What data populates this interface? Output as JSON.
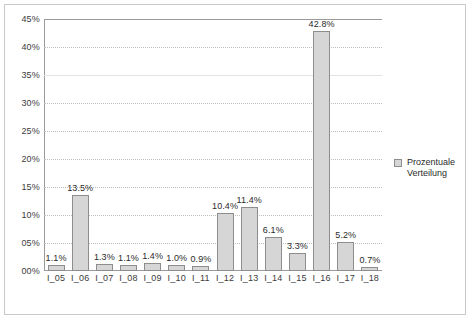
{
  "chart_data": {
    "type": "bar",
    "title": "",
    "subtitle": "",
    "xlabel": "",
    "ylabel": "",
    "ylim": [
      0,
      45
    ],
    "y_tick_step": 5,
    "y_tick_labels": [
      "00%",
      "05%",
      "10%",
      "15%",
      "20%",
      "25%",
      "30%",
      "35%",
      "40%",
      "45%"
    ],
    "y_tick_values": [
      0,
      5,
      10,
      15,
      20,
      25,
      30,
      35,
      40,
      45
    ],
    "grid": "horizontal-dotted",
    "legend_position": "right",
    "categories": [
      "I_05",
      "I_06",
      "I_07",
      "I_08",
      "I_09",
      "I_10",
      "I_11",
      "I_12",
      "I_13",
      "I_14",
      "I_15",
      "I_16",
      "I_17",
      "I_18"
    ],
    "values": [
      1.1,
      13.5,
      1.3,
      1.1,
      1.4,
      1.0,
      0.9,
      10.4,
      11.4,
      6.1,
      3.3,
      42.8,
      5.2,
      0.7
    ],
    "data_labels": [
      "1.1%",
      "13.5%",
      "1.3%",
      "1.1%",
      "1.4%",
      "1.0%",
      "0.9%",
      "10.4%",
      "11.4%",
      "6.1%",
      "3.3%",
      "42.8%",
      "5.2%",
      "0.7%"
    ],
    "series": [
      {
        "name": "Prozentuale Verteilung",
        "values": [
          1.1,
          13.5,
          1.3,
          1.1,
          1.4,
          1.0,
          0.9,
          10.4,
          11.4,
          6.1,
          3.3,
          42.8,
          5.2,
          0.7
        ]
      }
    ]
  },
  "legend": {
    "entries": [
      {
        "label": "Prozentuale Verteilung",
        "color": "#d6d6d6"
      }
    ]
  },
  "colors": {
    "bar_fill": "#d6d6d6",
    "bar_stroke": "#8d8d8d",
    "gridline": "#bdbdbd",
    "axis": "#9a9a9a",
    "frame": "#c9c9c9",
    "text": "#2b2b2b",
    "background": "#ffffff"
  }
}
